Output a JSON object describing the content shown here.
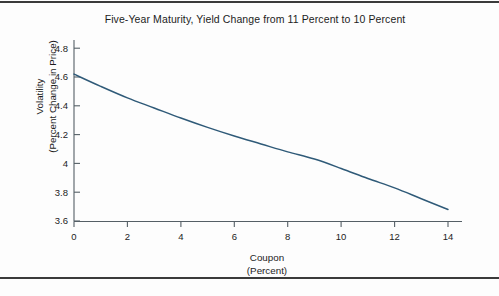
{
  "figure": {
    "title": "Five-Year Maturity, Yield Change from 11 Percent to 10 Percent",
    "background_color": "#fdfdfd",
    "rule_color": "#3a3a3a",
    "axis_color": "#555f66"
  },
  "axes": {
    "y_label_line1": "Volatility",
    "y_label_line2": "(Percent Change in Price)",
    "x_label_line1": "Coupon",
    "x_label_line2": "(Percent)",
    "y_ticks": [
      "4.8",
      "4.6",
      "4.4",
      "4.2",
      "4",
      "3.8",
      "3.6"
    ],
    "x_ticks": [
      "0",
      "2",
      "4",
      "6",
      "8",
      "10",
      "12",
      "14"
    ]
  },
  "chart_data": {
    "type": "line",
    "title": "Five-Year Maturity, Yield Change from 11 Percent to 10 Percent",
    "xlabel": "Coupon (Percent)",
    "ylabel": "Volatility (Percent Change in Price)",
    "xlim": [
      0,
      14.4
    ],
    "ylim": [
      3.6,
      4.85
    ],
    "xticks": [
      0,
      2,
      4,
      6,
      8,
      10,
      12,
      14
    ],
    "yticks": [
      3.6,
      3.8,
      4.0,
      4.2,
      4.4,
      4.6,
      4.8
    ],
    "grid": false,
    "legend": "none",
    "line_color": "#2f5a78",
    "series": [
      {
        "name": "Volatility vs Coupon",
        "x": [
          0,
          1,
          2,
          3,
          4,
          5,
          6,
          7,
          8,
          9,
          10,
          11,
          12,
          13,
          14
        ],
        "y": [
          4.62,
          4.535,
          4.455,
          4.385,
          4.315,
          4.25,
          4.19,
          4.135,
          4.08,
          4.03,
          3.965,
          3.895,
          3.83,
          3.755,
          3.68
        ]
      }
    ]
  }
}
